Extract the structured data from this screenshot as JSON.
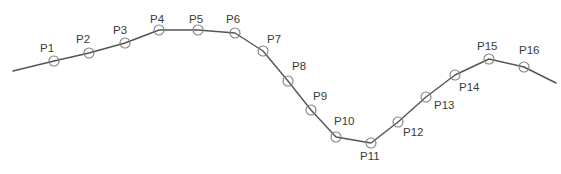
{
  "figure": {
    "type": "polyline-vertex-diagram",
    "width": 561,
    "height": 174,
    "background_color": "#ffffff",
    "line_color": "#545454",
    "line_width": 1.4,
    "marker": {
      "shape": "circle",
      "radius": 5,
      "stroke_color": "#808080",
      "stroke_width": 1.1,
      "fill": "none"
    },
    "label_color": "#3b3b3b",
    "label_font_size": 11.5
  },
  "chart_data": {
    "type": "line",
    "title": "",
    "xlabel": "",
    "ylabel": "",
    "grid": false,
    "legend": null,
    "xlim": [
      0,
      561
    ],
    "ylim": [
      174,
      0
    ],
    "note": "Open polyline with 16 labelled circular vertex markers; coordinates are in screen pixels (y increases downward).",
    "path_start": {
      "x": 13,
      "y": 71
    },
    "path_end": {
      "x": 556,
      "y": 83
    },
    "labels": [
      "P1",
      "P2",
      "P3",
      "P4",
      "P5",
      "P6",
      "P7",
      "P8",
      "P9",
      "P10",
      "P11",
      "P12",
      "P13",
      "P14",
      "P15",
      "P16"
    ],
    "x": [
      54,
      89,
      125,
      159,
      198,
      235,
      263,
      288,
      311,
      336,
      371,
      398,
      426,
      455,
      489,
      524
    ],
    "y": [
      61,
      53,
      43,
      30,
      30,
      33,
      51,
      81,
      110,
      137,
      143,
      122,
      97,
      75,
      59,
      67
    ],
    "points": [
      {
        "label": "P1",
        "x": 54,
        "y": 61,
        "label_x": 40,
        "label_y": 42
      },
      {
        "label": "P2",
        "x": 89,
        "y": 53,
        "label_x": 76,
        "label_y": 33
      },
      {
        "label": "P3",
        "x": 125,
        "y": 43,
        "label_x": 113,
        "label_y": 24
      },
      {
        "label": "P4",
        "x": 159,
        "y": 30,
        "label_x": 150,
        "label_y": 13
      },
      {
        "label": "P5",
        "x": 198,
        "y": 30,
        "label_x": 189,
        "label_y": 13
      },
      {
        "label": "P6",
        "x": 235,
        "y": 33,
        "label_x": 226,
        "label_y": 13
      },
      {
        "label": "P7",
        "x": 263,
        "y": 51,
        "label_x": 267,
        "label_y": 33
      },
      {
        "label": "P8",
        "x": 288,
        "y": 81,
        "label_x": 292,
        "label_y": 60
      },
      {
        "label": "P9",
        "x": 311,
        "y": 110,
        "label_x": 313,
        "label_y": 90
      },
      {
        "label": "P10",
        "x": 336,
        "y": 137,
        "label_x": 334,
        "label_y": 115
      },
      {
        "label": "P11",
        "x": 371,
        "y": 143,
        "label_x": 360,
        "label_y": 150
      },
      {
        "label": "P12",
        "x": 398,
        "y": 122,
        "label_x": 403,
        "label_y": 126
      },
      {
        "label": "P13",
        "x": 426,
        "y": 97,
        "label_x": 434,
        "label_y": 99
      },
      {
        "label": "P14",
        "x": 455,
        "y": 75,
        "label_x": 459,
        "label_y": 81
      },
      {
        "label": "P15",
        "x": 489,
        "y": 59,
        "label_x": 477,
        "label_y": 40
      },
      {
        "label": "P16",
        "x": 524,
        "y": 67,
        "label_x": 519,
        "label_y": 44
      }
    ]
  }
}
